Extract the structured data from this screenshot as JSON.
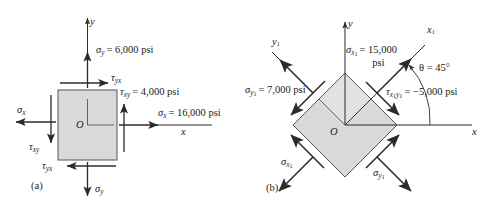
{
  "figure": {
    "type": "stress-element-diagram",
    "panels": [
      {
        "tag": "(a)",
        "name": "original-element",
        "center_label": "O",
        "axes": [
          {
            "name": "y-axis",
            "label": "y",
            "direction": "up"
          },
          {
            "name": "x-axis",
            "label": "x",
            "direction": "right"
          }
        ],
        "stresses": [
          {
            "symbol": "σ",
            "sub": "y",
            "value": "6,000",
            "unit": "psi",
            "text": "= 6,000 psi",
            "face": "top",
            "sense": "tension-up"
          },
          {
            "symbol": "τ",
            "sub": "yx",
            "value": "",
            "unit": "",
            "text": "",
            "face": "top",
            "sense": "right"
          },
          {
            "symbol": "τ",
            "sub": "xy",
            "value": "4,000",
            "unit": "psi",
            "text": "= 4,000 psi",
            "face": "right",
            "sense": "up"
          },
          {
            "symbol": "σ",
            "sub": "x",
            "value": "16,000",
            "unit": "psi",
            "text": "= 16,000 psi",
            "face": "right",
            "sense": "tension-right"
          },
          {
            "symbol": "σ",
            "sub": "x",
            "value": "",
            "unit": "",
            "text": "",
            "face": "left",
            "sense": "tension-left"
          },
          {
            "symbol": "τ",
            "sub": "xy",
            "value": "",
            "unit": "",
            "text": "",
            "face": "left",
            "sense": "down"
          },
          {
            "symbol": "τ",
            "sub": "yx",
            "value": "",
            "unit": "",
            "text": "",
            "face": "bottom",
            "sense": "left"
          },
          {
            "symbol": "σ",
            "sub": "y",
            "value": "",
            "unit": "",
            "text": "",
            "face": "bottom",
            "sense": "tension-down"
          }
        ]
      },
      {
        "tag": "(b)",
        "name": "rotated-element",
        "center_label": "O",
        "angle_label": "θ = 45°",
        "angle_value": "45",
        "axes": [
          {
            "name": "y-axis",
            "label": "y",
            "direction": "up"
          },
          {
            "name": "x-axis",
            "label": "x",
            "direction": "right"
          },
          {
            "name": "x1-axis",
            "label": "x",
            "sub": "1",
            "direction": "up-right-45"
          },
          {
            "name": "y1-axis",
            "label": "y",
            "sub": "1",
            "direction": "up-left-45"
          }
        ],
        "stresses": [
          {
            "symbol": "σ",
            "sub": "x1",
            "value": "15,000",
            "unit": "psi",
            "line1": "= 15,000",
            "line2": "psi",
            "face": "x1-positive"
          },
          {
            "symbol": "τ",
            "sub": "x1y1",
            "value": "−5,000",
            "unit": "psi",
            "text": "= −5,000 psi",
            "face": "x1-positive"
          },
          {
            "symbol": "σ",
            "sub": "y1",
            "value": "7,000",
            "unit": "psi",
            "text": "= 7,000 psi",
            "face": "y1-positive"
          },
          {
            "symbol": "σ",
            "sub": "x1",
            "value": "",
            "unit": "",
            "text": "",
            "face": "x1-negative"
          },
          {
            "symbol": "σ",
            "sub": "y1",
            "value": "",
            "unit": "",
            "text": "",
            "face": "y1-negative"
          }
        ]
      }
    ],
    "labels": {
      "panel_a_tag": "(a)",
      "panel_b_tag": "(b)",
      "a_sigma_y_top": "= 6,000 psi",
      "a_tau_yx_top": "",
      "a_tau_xy_right": "= 4,000 psi",
      "a_sigma_x_right": "= 16,000 psi",
      "a_center": "O",
      "a_axis_y": "y",
      "a_axis_x": "x",
      "b_sigma_x1_line1": "= 15,000",
      "b_sigma_x1_line2": "psi",
      "b_tau_x1y1": "= −5,000 psi",
      "b_sigma_y1": "= 7,000 psi",
      "b_theta": "θ = 45°",
      "b_center": "O",
      "b_axis_y": "y",
      "b_axis_x": "x",
      "b_axis_x1": "x",
      "b_axis_y1": "y",
      "sym_sigma": "σ",
      "sym_tau": "τ",
      "sub_x": "x",
      "sub_y": "y",
      "sub_xy": "xy",
      "sub_yx": "yx",
      "sub_1": "1"
    },
    "colors": {
      "element_fill": "#d9d9d9",
      "inner_fill": "#e2e2e2",
      "stroke": "#3a3a3a",
      "arrow": "#2b2b2b",
      "background": "#ffffff",
      "text": "#1a1a1a"
    }
  }
}
